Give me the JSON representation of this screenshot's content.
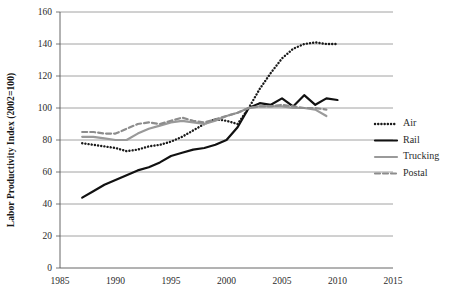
{
  "chart_data": {
    "type": "line",
    "title": "",
    "xlabel": "",
    "ylabel": "Labor Productivity Index (2002=100)",
    "xlim": [
      1985,
      2015
    ],
    "ylim": [
      0,
      160
    ],
    "xticks": [
      1985,
      1990,
      1995,
      2000,
      2005,
      2010,
      2015
    ],
    "yticks": [
      0,
      20,
      40,
      60,
      80,
      100,
      120,
      140,
      160
    ],
    "grid": "horizontal",
    "legend_position": "right",
    "series": [
      {
        "name": "Air",
        "style": "dotted",
        "color": "#1a1a1a",
        "x": [
          1987,
          1988,
          1989,
          1990,
          1991,
          1992,
          1993,
          1994,
          1995,
          1996,
          1997,
          1998,
          1999,
          2000,
          2001,
          2002,
          2003,
          2004,
          2005,
          2006,
          2007,
          2008,
          2009,
          2010
        ],
        "y": [
          78,
          77,
          76,
          75,
          73,
          74,
          76,
          77,
          79,
          82,
          86,
          90,
          93,
          92,
          90,
          100,
          112,
          122,
          131,
          137,
          140,
          141,
          140,
          140
        ]
      },
      {
        "name": "Rail",
        "style": "solid",
        "color": "#111111",
        "x": [
          1987,
          1988,
          1989,
          1990,
          1991,
          1992,
          1993,
          1994,
          1995,
          1996,
          1997,
          1998,
          1999,
          2000,
          2001,
          2002,
          2003,
          2004,
          2005,
          2006,
          2007,
          2008,
          2009,
          2010
        ],
        "y": [
          44,
          48,
          52,
          55,
          58,
          61,
          63,
          66,
          70,
          72,
          74,
          75,
          77,
          80,
          88,
          100,
          103,
          102,
          106,
          101,
          108,
          102,
          106,
          105
        ]
      },
      {
        "name": "Trucking",
        "style": "solid",
        "color": "#9a9a9a",
        "x": [
          1987,
          1988,
          1989,
          1990,
          1991,
          1992,
          1993,
          1994,
          1995,
          1996,
          1997,
          1998,
          1999,
          2000,
          2001,
          2002,
          2003,
          2004,
          2005,
          2006,
          2007,
          2008,
          2009
        ],
        "y": [
          82,
          82,
          81,
          80,
          80,
          84,
          87,
          89,
          91,
          92,
          91,
          90,
          92,
          95,
          97,
          100,
          101,
          101,
          101,
          100,
          100,
          99,
          95
        ]
      },
      {
        "name": "Postal",
        "style": "dashed",
        "color": "#8d8d8d",
        "x": [
          1987,
          1988,
          1989,
          1990,
          1991,
          1992,
          1993,
          1994,
          1995,
          1996,
          1997,
          1998,
          1999,
          2000,
          2001,
          2002,
          2003,
          2004,
          2005,
          2006,
          2007,
          2008,
          2009
        ],
        "y": [
          85,
          85,
          84,
          84,
          87,
          90,
          91,
          90,
          92,
          94,
          92,
          91,
          93,
          95,
          97,
          100,
          101,
          101,
          102,
          101,
          100,
          100,
          99
        ]
      }
    ]
  },
  "legend": {
    "items": [
      {
        "label": "Air"
      },
      {
        "label": "Rail"
      },
      {
        "label": "Trucking"
      },
      {
        "label": "Postal"
      }
    ]
  },
  "colors": {
    "air": "#1a1a1a",
    "rail": "#111111",
    "trucking": "#9a9a9a",
    "postal": "#8d8d8d",
    "grid": "#8c8c8c",
    "axis": "#555555",
    "background": "#ffffff"
  }
}
